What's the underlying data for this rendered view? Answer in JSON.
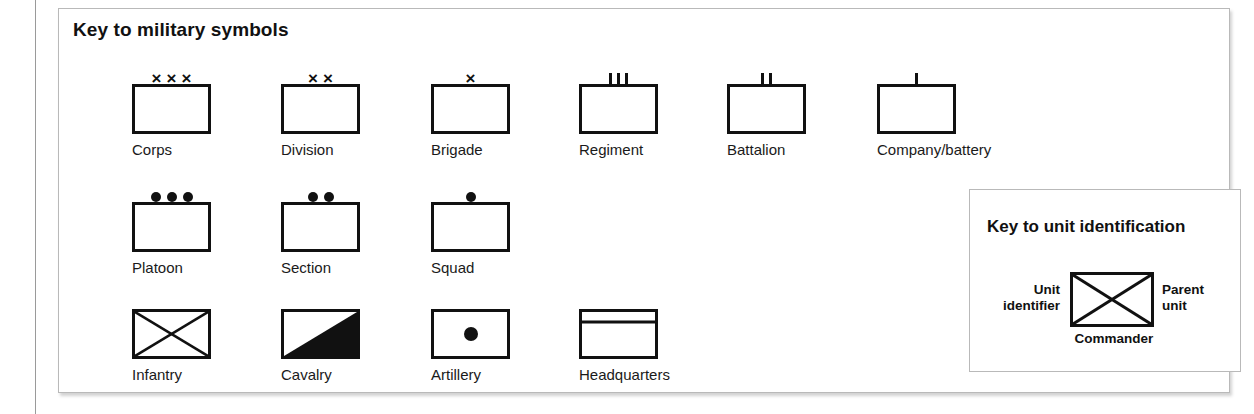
{
  "panel": {
    "title": "Key to military symbols"
  },
  "rows": [
    {
      "row_name": "echelon-size-row",
      "entries": [
        {
          "label": "Corps",
          "echelon": "xxx",
          "marks": 3,
          "mark_glyph": "×",
          "fill": "none",
          "x": 73,
          "y": 75
        },
        {
          "label": "Division",
          "echelon": "xx",
          "marks": 2,
          "mark_glyph": "×",
          "fill": "none",
          "x": 222,
          "y": 75
        },
        {
          "label": "Brigade",
          "echelon": "x",
          "marks": 1,
          "mark_glyph": "×",
          "fill": "none",
          "x": 372,
          "y": 75
        },
        {
          "label": "Regiment",
          "echelon": "III",
          "marks": 3,
          "mark_glyph": "bar",
          "fill": "none",
          "x": 520,
          "y": 75
        },
        {
          "label": "Battalion",
          "echelon": "II",
          "marks": 2,
          "mark_glyph": "bar",
          "fill": "none",
          "x": 668,
          "y": 75
        },
        {
          "label": "Company/battery",
          "echelon": "I",
          "marks": 1,
          "mark_glyph": "bar",
          "fill": "none",
          "x": 818,
          "y": 75
        }
      ]
    },
    {
      "row_name": "sub-unit-row",
      "entries": [
        {
          "label": "Platoon",
          "echelon": "•••",
          "marks": 3,
          "mark_glyph": "dot",
          "fill": "none",
          "x": 73,
          "y": 193
        },
        {
          "label": "Section",
          "echelon": "••",
          "marks": 2,
          "mark_glyph": "dot",
          "fill": "none",
          "x": 222,
          "y": 193
        },
        {
          "label": "Squad",
          "echelon": "•",
          "marks": 1,
          "mark_glyph": "dot",
          "fill": "none",
          "x": 372,
          "y": 193
        }
      ]
    },
    {
      "row_name": "branch-row",
      "entries": [
        {
          "label": "Infantry",
          "echelon": "",
          "marks": 0,
          "mark_glyph": "none",
          "fill": "infantry",
          "x": 73,
          "y": 300
        },
        {
          "label": "Cavalry",
          "echelon": "",
          "marks": 0,
          "mark_glyph": "none",
          "fill": "cavalry",
          "x": 222,
          "y": 300
        },
        {
          "label": "Artillery",
          "echelon": "",
          "marks": 0,
          "mark_glyph": "none",
          "fill": "artillery",
          "x": 372,
          "y": 300
        },
        {
          "label": "Headquarters",
          "echelon": "",
          "marks": 0,
          "mark_glyph": "none",
          "fill": "hq",
          "x": 520,
          "y": 300
        }
      ]
    }
  ],
  "unit_id": {
    "title": "Key to unit identification",
    "left_label_line1": "Unit",
    "left_label_line2": "identifier",
    "right_label_line1": "Parent",
    "right_label_line2": "unit",
    "bottom_label": "Commander",
    "figure_name": "infantry-symbol"
  },
  "colors": {
    "ink": "#111111",
    "panel_border": "#b9b9b9",
    "page_rule": "#9a9a9a",
    "background": "#ffffff"
  }
}
